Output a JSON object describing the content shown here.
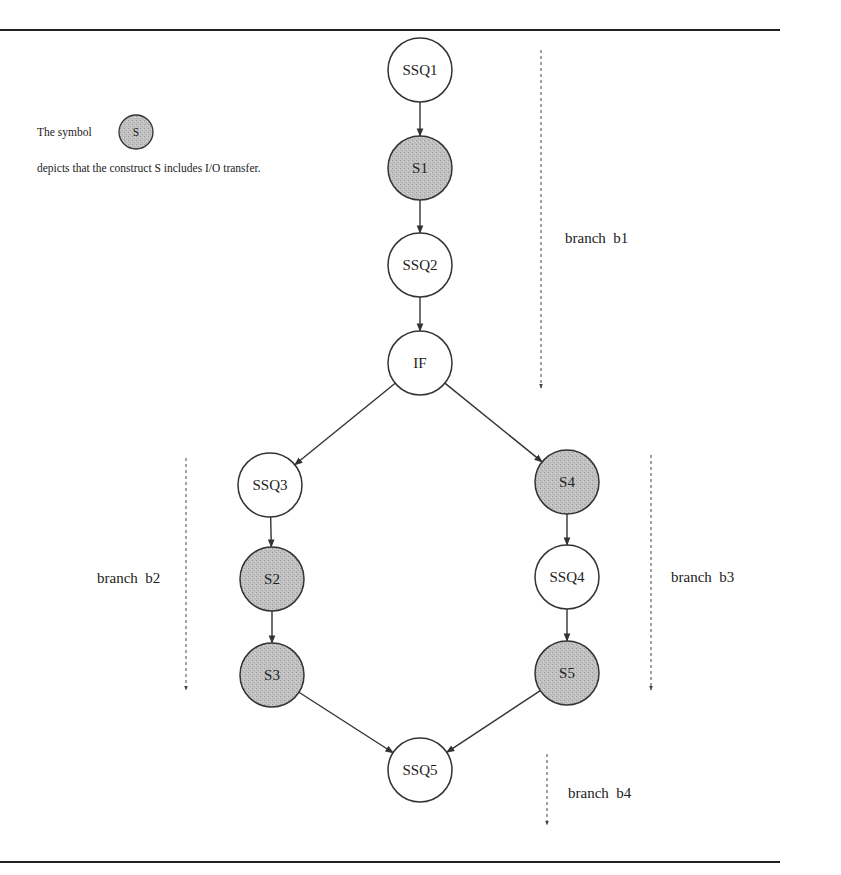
{
  "legend": {
    "prefix": "The symbol",
    "symbol_label": "S",
    "description": "depicts that the construct  S includes I/O transfer."
  },
  "colors": {
    "io_fill": "#bdbdbd",
    "plain_fill": "#ffffff",
    "stroke": "#333333"
  },
  "nodes": [
    {
      "id": "SSQ1",
      "label": "SSQ1",
      "io": false,
      "x": 420,
      "y": 70
    },
    {
      "id": "S1",
      "label": "S1",
      "io": true,
      "x": 420,
      "y": 168
    },
    {
      "id": "SSQ2",
      "label": "SSQ2",
      "io": false,
      "x": 420,
      "y": 265
    },
    {
      "id": "IF",
      "label": "IF",
      "io": false,
      "x": 420,
      "y": 363
    },
    {
      "id": "SSQ3",
      "label": "SSQ3",
      "io": false,
      "x": 270,
      "y": 485
    },
    {
      "id": "S2",
      "label": "S2",
      "io": true,
      "x": 272,
      "y": 579
    },
    {
      "id": "S3",
      "label": "S3",
      "io": true,
      "x": 272,
      "y": 675
    },
    {
      "id": "S4",
      "label": "S4",
      "io": true,
      "x": 567,
      "y": 482
    },
    {
      "id": "SSQ4",
      "label": "SSQ4",
      "io": false,
      "x": 567,
      "y": 577
    },
    {
      "id": "S5",
      "label": "S5",
      "io": true,
      "x": 567,
      "y": 673
    },
    {
      "id": "SSQ5",
      "label": "SSQ5",
      "io": false,
      "x": 420,
      "y": 770
    }
  ],
  "edges": [
    [
      "SSQ1",
      "S1"
    ],
    [
      "S1",
      "SSQ2"
    ],
    [
      "SSQ2",
      "IF"
    ],
    [
      "IF",
      "SSQ3"
    ],
    [
      "IF",
      "S4"
    ],
    [
      "SSQ3",
      "S2"
    ],
    [
      "S2",
      "S3"
    ],
    [
      "S4",
      "SSQ4"
    ],
    [
      "SSQ4",
      "S5"
    ],
    [
      "S3",
      "SSQ5"
    ],
    [
      "S5",
      "SSQ5"
    ]
  ],
  "branches": [
    {
      "label": "branch  b1",
      "line_x": 541,
      "y1": 50,
      "y2": 388,
      "label_x": 565,
      "label_y": 243
    },
    {
      "label": "branch  b2",
      "line_x": 186,
      "y1": 458,
      "y2": 690,
      "label_x": 97,
      "label_y": 583
    },
    {
      "label": "branch  b3",
      "line_x": 651,
      "y1": 455,
      "y2": 690,
      "label_x": 671,
      "label_y": 582
    },
    {
      "label": "branch  b4",
      "line_x": 547,
      "y1": 754,
      "y2": 825,
      "label_x": 568,
      "label_y": 798
    }
  ]
}
